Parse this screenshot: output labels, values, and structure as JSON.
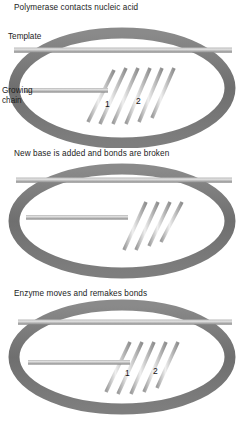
{
  "figure": {
    "background": "#ffffff",
    "colors": {
      "ring": "#7c7c7c",
      "ring_shadow": "#5e5e5e",
      "bar": "#8c8c8c",
      "bar_light": "#cfcfcf",
      "tooth": "#9a9a9a",
      "tooth_light": "#e3e3e3",
      "text": "#1b1b1b"
    }
  },
  "panels": [
    {
      "id": "panel-polymerase-contacts",
      "caption": "Polymerase contacts nucleic acid",
      "labels": {
        "template": "Template",
        "growing_chain_line1": "Growing",
        "growing_chain_line2": "chain",
        "number_one": "1",
        "number_two": "2"
      },
      "template_teeth": 16,
      "growing_chain_teeth": 5,
      "incoming_nucleotides": 6,
      "detached_bases": 0
    },
    {
      "id": "panel-new-base-added",
      "caption": "New base is added and bonds are broken",
      "labels": {},
      "template_teeth": 16,
      "growing_chain_teeth": 0,
      "incoming_nucleotides": 4,
      "detached_bases": 4
    },
    {
      "id": "panel-enzyme-moves",
      "caption": "Enzyme moves and remakes bonds",
      "labels": {
        "number_one": "1",
        "number_two": "2"
      },
      "template_teeth": 16,
      "growing_chain_teeth": 5,
      "incoming_nucleotides": 5,
      "detached_bases": 0
    }
  ]
}
